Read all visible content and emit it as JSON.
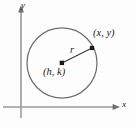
{
  "figure": {
    "background_color": "#fdfdfd",
    "axes": {
      "x_label": "x",
      "y_label": "y",
      "axis_color": "#9a9a9a",
      "origin": {
        "x": 21,
        "y": 107
      },
      "x_axis_end": {
        "x": 120,
        "y": 107
      },
      "y_axis_end": {
        "x": 21,
        "y": 8
      },
      "arrow_heads": [
        "x-positive",
        "y-positive"
      ]
    },
    "circle": {
      "center": {
        "x": 62,
        "y": 63
      },
      "radius": 35,
      "stroke_color": "#6e6e6e",
      "fill": "none",
      "center_label": "(h, k)",
      "center_dot": true
    },
    "radius_segment": {
      "label": "r",
      "from": {
        "x": 62,
        "y": 63
      },
      "to": {
        "x": 92,
        "y": 48
      },
      "stroke_color": "#3a3a3a"
    },
    "boundary_point": {
      "label": "(x, y)",
      "position": {
        "x": 92,
        "y": 48
      },
      "dot": true
    }
  }
}
